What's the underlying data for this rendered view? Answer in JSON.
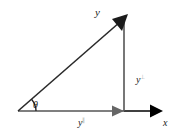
{
  "diagram": {
    "labels": {
      "vector": "y",
      "perpendicular": "y",
      "perpendicular_sup": "⊥",
      "parallel": "y",
      "parallel_sup": "∥",
      "axis": "x",
      "angle": "θ"
    },
    "colors": {
      "vector": "#2a2a2a",
      "component_line": "#555555",
      "component_arrow": "#666666",
      "axis_arrow": "#000000"
    }
  }
}
